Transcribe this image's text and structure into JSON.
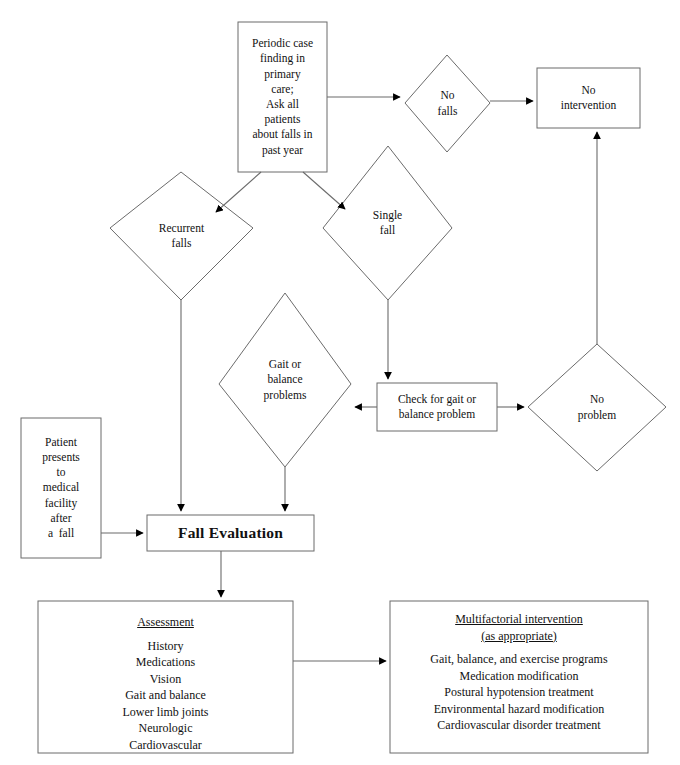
{
  "diagram": {
    "colors": {
      "stroke": "#6b6b6b",
      "arrow": "#000000",
      "fill": "#ffffff",
      "text": "#111111"
    },
    "nodes": {
      "periodic_case_finding": {
        "shape": "rectangle",
        "lines": [
          "Periodic case",
          "finding in",
          "primary",
          "care;",
          "Ask all",
          "patients",
          "about falls in",
          "past year"
        ]
      },
      "no_falls": {
        "shape": "diamond",
        "lines": [
          "No",
          "falls"
        ]
      },
      "no_intervention": {
        "shape": "rectangle",
        "lines": [
          "No",
          "intervention"
        ]
      },
      "recurrent_falls": {
        "shape": "diamond",
        "lines": [
          "Recurrent",
          "falls"
        ]
      },
      "single_fall": {
        "shape": "diamond",
        "lines": [
          "Single",
          "fall"
        ]
      },
      "gait_or_balance_problems": {
        "shape": "diamond",
        "lines": [
          "Gait or",
          "balance",
          "problems"
        ]
      },
      "check_for_gait": {
        "shape": "rectangle",
        "lines": [
          "Check for gait or",
          "balance problem"
        ]
      },
      "no_problem": {
        "shape": "diamond",
        "lines": [
          "No",
          "problem"
        ]
      },
      "patient_presents": {
        "shape": "rectangle",
        "lines": [
          "Patient",
          "presents",
          "to",
          "medical",
          "facility",
          "after",
          "a  fall"
        ]
      },
      "fall_evaluation": {
        "shape": "rectangle",
        "lines": [
          "Fall Evaluation"
        ]
      },
      "assessment": {
        "shape": "rectangle",
        "title": "Assessment",
        "items": [
          "History",
          "Medications",
          "Vision",
          "Gait and balance",
          "Lower limb joints",
          "Neurologic",
          "Cardiovascular"
        ]
      },
      "multifactorial_intervention": {
        "shape": "rectangle",
        "title": "Multifactorial intervention",
        "subtitle": "(as appropriate)",
        "items": [
          "Gait, balance, and exercise programs",
          "Medication modification",
          "Postural hypotension treatment",
          "Environmental hazard modification",
          "Cardiovascular disorder treatment"
        ]
      }
    },
    "edges": [
      {
        "from": "periodic_case_finding",
        "to": "no_falls"
      },
      {
        "from": "no_falls",
        "to": "no_intervention"
      },
      {
        "from": "periodic_case_finding",
        "to": "recurrent_falls"
      },
      {
        "from": "periodic_case_finding",
        "to": "single_fall"
      },
      {
        "from": "single_fall",
        "to": "check_for_gait"
      },
      {
        "from": "check_for_gait",
        "to": "gait_or_balance_problems"
      },
      {
        "from": "check_for_gait",
        "to": "no_problem"
      },
      {
        "from": "no_problem",
        "to": "no_intervention"
      },
      {
        "from": "recurrent_falls",
        "to": "fall_evaluation"
      },
      {
        "from": "gait_or_balance_problems",
        "to": "fall_evaluation"
      },
      {
        "from": "patient_presents",
        "to": "fall_evaluation"
      },
      {
        "from": "fall_evaluation",
        "to": "assessment"
      },
      {
        "from": "assessment",
        "to": "multifactorial_intervention"
      }
    ]
  }
}
